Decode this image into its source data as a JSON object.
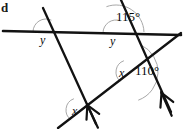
{
  "figure": {
    "kind": "geometry-angle-diagram",
    "corner_mark": "d",
    "stroke_color": "#121212",
    "arc_color": "#a8a8a8",
    "background": "#ffffff"
  },
  "lines": [
    {
      "name": "horizontal-line",
      "x1": 3,
      "y1": 31,
      "x2": 181,
      "y2": 35,
      "width": 2.6
    },
    {
      "name": "left-transversal",
      "x1": 43,
      "y1": 8,
      "x2": 96,
      "y2": 124,
      "width": 2.3
    },
    {
      "name": "right-transversal",
      "x1": 121,
      "y1": 0,
      "x2": 171,
      "y2": 112,
      "width": 2.3
    },
    {
      "name": "oblique-rising-line",
      "x1": 58,
      "y1": 128,
      "x2": 181,
      "y2": 33,
      "width": 2.3
    }
  ],
  "arrow_marks": [
    {
      "name": "parallel-mark-left",
      "x": 92,
      "y": 115,
      "angle": 65
    },
    {
      "name": "parallel-mark-right",
      "x": 166,
      "y": 103,
      "angle": 66
    }
  ],
  "arcs": [
    {
      "name": "angle-arc-y-left",
      "cx": 46,
      "cy": 32,
      "r": 13,
      "start": 180,
      "end": 295
    },
    {
      "name": "angle-arc-y-right",
      "cx": 116,
      "cy": 33,
      "r": 13,
      "start": 180,
      "end": 290
    },
    {
      "name": "angle-arc-115",
      "cx": 116,
      "cy": 33,
      "r": 28,
      "start": 250,
      "end": 358
    },
    {
      "name": "angle-arc-x-mid",
      "cx": 128,
      "cy": 72,
      "r": 12,
      "start": 130,
      "end": 250
    },
    {
      "name": "angle-arc-110",
      "cx": 128,
      "cy": 72,
      "r": 30,
      "start": 295,
      "end": 70
    },
    {
      "name": "angle-arc-x-low",
      "cx": 78,
      "cy": 110,
      "r": 12,
      "start": 125,
      "end": 250
    }
  ],
  "labels": [
    {
      "name": "label-y-left",
      "text": "y",
      "x": 40,
      "y": 34,
      "style": "var"
    },
    {
      "name": "label-y-right",
      "text": "y",
      "x": 110,
      "y": 35,
      "style": "var"
    },
    {
      "name": "label-115",
      "text": "115°",
      "x": 116,
      "y": 10,
      "style": "ang"
    },
    {
      "name": "label-x-mid",
      "text": "x",
      "x": 119,
      "y": 67,
      "style": "var"
    },
    {
      "name": "label-110",
      "text": "110°",
      "x": 135,
      "y": 64,
      "style": "ang"
    },
    {
      "name": "label-x-low",
      "text": "x",
      "x": 72,
      "y": 105,
      "style": "var"
    }
  ]
}
